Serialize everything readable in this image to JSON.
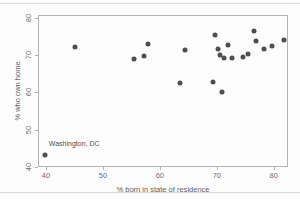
{
  "figure": {
    "background": "#fdfdfd",
    "rule_color": "#d8d8d8"
  },
  "chart_data": {
    "type": "scatter",
    "title": "",
    "xlabel": "% born in state of residence",
    "ylabel": "% who own home",
    "xlim": [
      38.6,
      82.5
    ],
    "ylim": [
      39.9,
      80.9
    ],
    "xticks": [
      40,
      50,
      60,
      70,
      80
    ],
    "yticks": [
      40,
      50,
      60,
      70,
      80
    ],
    "grid": false,
    "legend": "none",
    "marker": "filled-circle",
    "colors": {
      "point": "#4e4e4e",
      "frame": "#b4b4b4",
      "tick": "#b4b4b4",
      "tick_label": "#6e6e6e",
      "axis_title": "#5f5f5f",
      "annotation_text": "#4f4f4f"
    },
    "points": [
      [
        39.8,
        43.2
      ],
      [
        45.1,
        72.4
      ],
      [
        55.5,
        69.0
      ],
      [
        57.3,
        69.8
      ],
      [
        57.9,
        73.1
      ],
      [
        63.5,
        62.5
      ],
      [
        64.5,
        71.4
      ],
      [
        69.3,
        62.8
      ],
      [
        69.6,
        75.6
      ],
      [
        70.2,
        71.7
      ],
      [
        70.6,
        70.1
      ],
      [
        70.9,
        60.1
      ],
      [
        71.3,
        69.4
      ],
      [
        71.9,
        72.7
      ],
      [
        72.7,
        69.4
      ],
      [
        74.6,
        69.5
      ],
      [
        75.5,
        70.3
      ],
      [
        76.6,
        76.5
      ],
      [
        76.9,
        73.9
      ],
      [
        78.3,
        71.7
      ],
      [
        79.7,
        72.6
      ],
      [
        81.8,
        74.1
      ]
    ],
    "annotation": {
      "text": "Washington, DC",
      "x": 39.8,
      "y": 43.2
    }
  }
}
